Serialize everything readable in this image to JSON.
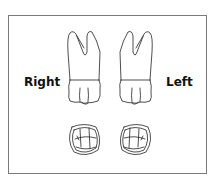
{
  "diagram": {
    "labels": {
      "right": "Right",
      "left": "Left"
    },
    "elements": [
      {
        "name": "right-tooth-lateral-view",
        "type": "tooth-crown-and-roots"
      },
      {
        "name": "left-tooth-lateral-view",
        "type": "tooth-crown-and-roots"
      },
      {
        "name": "right-tooth-occlusal-view",
        "type": "occlusal-surface"
      },
      {
        "name": "left-tooth-occlusal-view",
        "type": "occlusal-surface"
      }
    ],
    "colors": {
      "line": "#222222",
      "frame": "#7a7a7a",
      "background": "#ffffff"
    }
  }
}
